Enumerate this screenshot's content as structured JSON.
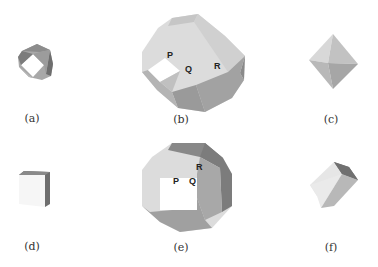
{
  "figure": {
    "panels": [
      {
        "id": "a",
        "caption": "(a)",
        "shape": "cuboctahedron-small"
      },
      {
        "id": "b",
        "caption": "(b)",
        "shape": "truncated-polyhedron",
        "points": [
          "P",
          "Q",
          "R"
        ]
      },
      {
        "id": "c",
        "caption": "(c)",
        "shape": "octahedron"
      },
      {
        "id": "d",
        "caption": "(d)",
        "shape": "cube-corner"
      },
      {
        "id": "e",
        "caption": "(e)",
        "shape": "truncated-polyhedron-front",
        "points": [
          "P",
          "Q",
          "R"
        ]
      },
      {
        "id": "f",
        "caption": "(f)",
        "shape": "cube"
      }
    ]
  },
  "labels": {
    "b": {
      "P": "P",
      "Q": "Q",
      "R": "R"
    },
    "e": {
      "P": "P",
      "Q": "Q",
      "R": "R"
    }
  },
  "colors": {
    "background": "#ffffff",
    "light": "#e6e6e6",
    "mid": "#c4c4c4",
    "dark": "#9a9a9a",
    "darker": "#7a7a7a",
    "white_face": "#ffffff"
  }
}
